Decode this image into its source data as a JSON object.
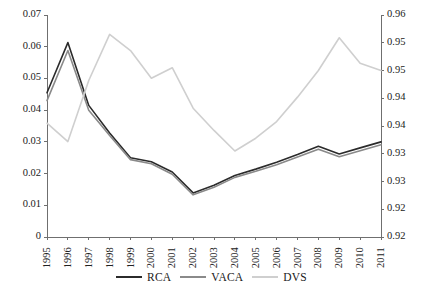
{
  "chart_data": {
    "type": "line",
    "title": "",
    "xlabel": "",
    "ylabel": "",
    "grid": false,
    "legend_position": "bottom-center",
    "categories": [
      "1995",
      "1996",
      "1997",
      "1998",
      "1999",
      "2000",
      "2001",
      "2002",
      "2003",
      "2004",
      "2005",
      "2006",
      "2007",
      "2008",
      "2009",
      "2010",
      "2011"
    ],
    "x": [
      1995,
      1996,
      1997,
      1998,
      1999,
      2000,
      2001,
      2002,
      2003,
      2004,
      2005,
      2006,
      2007,
      2008,
      2009,
      2010,
      2011
    ],
    "axes": {
      "left": {
        "ylim": [
          0,
          0.07
        ],
        "ticks": [
          0,
          0.01,
          0.02,
          0.03,
          0.04,
          0.05,
          0.06,
          0.07
        ],
        "ticklabels": [
          "0",
          "0.01",
          "0.02",
          "0.03",
          "0.04",
          "0.05",
          "0.06",
          "0.07"
        ],
        "series": [
          "RCA",
          "VACA"
        ]
      },
      "right": {
        "ylim": [
          0.92,
          0.96
        ],
        "ticks": [
          0.92,
          0.925,
          0.93,
          0.935,
          0.94,
          0.945,
          0.95,
          0.955,
          0.96
        ],
        "ticklabels": [
          "0.92",
          "0.92",
          "0.93",
          "0.93",
          "0.94",
          "0.94",
          "0.95",
          "0.95",
          "0.96"
        ],
        "series": [
          "DVS"
        ]
      }
    },
    "series": [
      {
        "name": "RCA",
        "axis": "left",
        "color": "#2b2b2b",
        "values": [
          0.0455,
          0.0613,
          0.0415,
          0.0328,
          0.025,
          0.0237,
          0.0205,
          0.0139,
          0.0163,
          0.0194,
          0.0214,
          0.0236,
          0.026,
          0.0286,
          0.0262,
          0.0281,
          0.03
        ]
      },
      {
        "name": "VACA",
        "axis": "left",
        "color": "#8a8a8a",
        "values": [
          0.043,
          0.0588,
          0.04,
          0.032,
          0.0244,
          0.0231,
          0.0198,
          0.0133,
          0.0157,
          0.0188,
          0.0207,
          0.0228,
          0.0252,
          0.0277,
          0.0253,
          0.0272,
          0.0291
        ]
      },
      {
        "name": "DVS",
        "axis": "right",
        "color": "#cfcfcf",
        "values": [
          0.9405,
          0.9372,
          0.9482,
          0.9565,
          0.9536,
          0.9486,
          0.9505,
          0.9432,
          0.9392,
          0.9355,
          0.9378,
          0.9408,
          0.9452,
          0.95,
          0.9559,
          0.9513,
          0.95
        ]
      }
    ],
    "legend": [
      {
        "label": "RCA",
        "color": "#2b2b2b"
      },
      {
        "label": "VACA",
        "color": "#8a8a8a"
      },
      {
        "label": "DVS",
        "color": "#cfcfcf"
      }
    ]
  },
  "colors": {
    "axis": "#6f6f6f",
    "text": "#1a1a1a",
    "background": "#ffffff"
  }
}
